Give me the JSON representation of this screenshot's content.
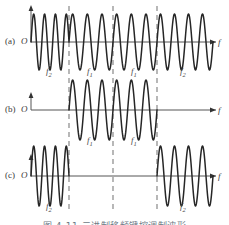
{
  "figure": {
    "title_caption": "图 4-11  二进制移频键控调制波形",
    "axis_label": "f",
    "origin_label": "O",
    "panels": [
      {
        "id": "a",
        "label": "(a)",
        "description": "continuous FSK carrier, all four segments present",
        "segments": [
          {
            "label": "f",
            "sub": "2",
            "active": true
          },
          {
            "label": "f",
            "sub": "1",
            "active": true
          },
          {
            "label": "f",
            "sub": "1",
            "active": true
          },
          {
            "label": "f",
            "sub": "2",
            "active": true
          }
        ]
      },
      {
        "id": "b",
        "label": "(b)",
        "description": "only the two middle f1 segments are present",
        "segments": [
          {
            "label": "f",
            "sub": "2",
            "active": false
          },
          {
            "label": "f",
            "sub": "1",
            "active": true
          },
          {
            "label": "f",
            "sub": "1",
            "active": true
          },
          {
            "label": "f",
            "sub": "2",
            "active": false
          }
        ]
      },
      {
        "id": "c",
        "label": "(c)",
        "description": "only the two outer f2 segments are present",
        "segments": [
          {
            "label": "f",
            "sub": "2",
            "active": true
          },
          {
            "label": "f",
            "sub": "1",
            "active": false
          },
          {
            "label": "f",
            "sub": "1",
            "active": false
          },
          {
            "label": "f",
            "sub": "2",
            "active": true
          }
        ]
      }
    ],
    "colors": {
      "wave": "#262626",
      "axis": "#555555",
      "dashed_guide": "#9a9a9a",
      "text": "#3a3a3a",
      "caption": "#6e7a86",
      "background": "#ffffff"
    }
  },
  "chart_data": {
    "type": "line",
    "xlabel": "f",
    "ylabel": "",
    "grid": false,
    "legend": "none",
    "x_guides": [
      69,
      113,
      157
    ],
    "segment_boundaries_x": [
      31,
      69,
      113,
      157,
      213
    ],
    "series": [
      {
        "name": "(a) composite FSK signal",
        "segments": [
          {
            "from_x": 31,
            "to_x": 69,
            "frequency_label": "f2",
            "cycles": 3.5,
            "amplitude": 1,
            "on": true
          },
          {
            "from_x": 69,
            "to_x": 113,
            "frequency_label": "f1",
            "cycles": 3,
            "amplitude": 1,
            "on": true
          },
          {
            "from_x": 113,
            "to_x": 157,
            "frequency_label": "f1",
            "cycles": 3,
            "amplitude": 1,
            "on": true
          },
          {
            "from_x": 157,
            "to_x": 213,
            "frequency_label": "f2",
            "cycles": 4,
            "amplitude": 1,
            "on": true
          }
        ]
      },
      {
        "name": "(b) f1 component",
        "segments": [
          {
            "from_x": 31,
            "to_x": 69,
            "frequency_label": "f2",
            "cycles": 0,
            "amplitude": 0,
            "on": false
          },
          {
            "from_x": 69,
            "to_x": 113,
            "frequency_label": "f1",
            "cycles": 3,
            "amplitude": 1,
            "on": true
          },
          {
            "from_x": 113,
            "to_x": 157,
            "frequency_label": "f1",
            "cycles": 3,
            "amplitude": 1,
            "on": true
          },
          {
            "from_x": 157,
            "to_x": 213,
            "frequency_label": "f2",
            "cycles": 0,
            "amplitude": 0,
            "on": false
          }
        ]
      },
      {
        "name": "(c) f2 component",
        "segments": [
          {
            "from_x": 31,
            "to_x": 69,
            "frequency_label": "f2",
            "cycles": 3.5,
            "amplitude": 1,
            "on": true
          },
          {
            "from_x": 69,
            "to_x": 113,
            "frequency_label": "f1",
            "cycles": 0,
            "amplitude": 0,
            "on": false
          },
          {
            "from_x": 113,
            "to_x": 157,
            "frequency_label": "f1",
            "cycles": 0,
            "amplitude": 0,
            "on": false
          },
          {
            "from_x": 157,
            "to_x": 213,
            "frequency_label": "f2",
            "cycles": 4,
            "amplitude": 1,
            "on": true
          }
        ]
      }
    ]
  }
}
